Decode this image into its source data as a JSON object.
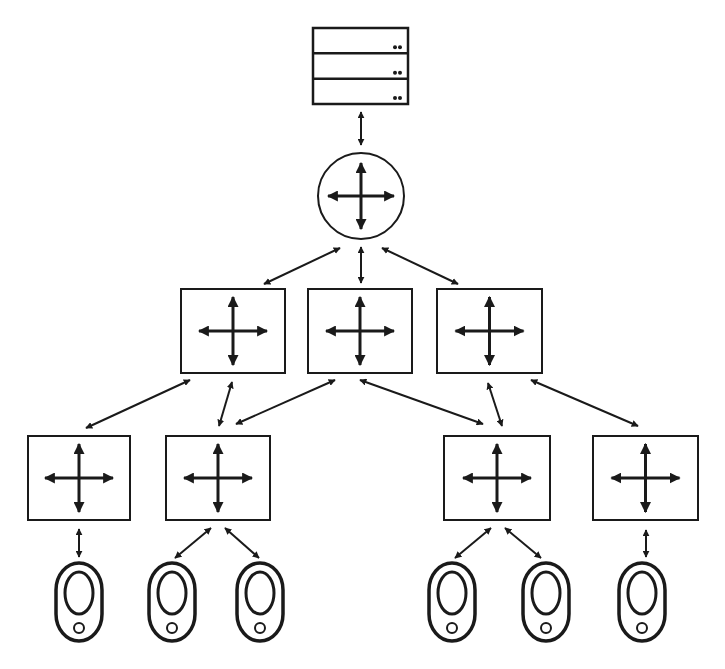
{
  "diagram": {
    "stroke_color": "#1a1a1a",
    "background": "#ffffff",
    "nodes": {
      "server": {
        "type": "server-rack",
        "x": 313,
        "y": 28,
        "w": 95,
        "h": 76,
        "units": 3
      },
      "router": {
        "type": "router",
        "cx": 361,
        "cy": 196,
        "r": 43
      },
      "distribution_switches": [
        {
          "id": "dist-1",
          "x": 181,
          "y": 289,
          "w": 104,
          "h": 84
        },
        {
          "id": "dist-2",
          "x": 308,
          "y": 289,
          "w": 104,
          "h": 84
        },
        {
          "id": "dist-3",
          "x": 437,
          "y": 289,
          "w": 105,
          "h": 84
        }
      ],
      "access_switches": [
        {
          "id": "acc-1",
          "x": 28,
          "y": 436,
          "w": 102,
          "h": 84
        },
        {
          "id": "acc-2",
          "x": 166,
          "y": 436,
          "w": 104,
          "h": 84
        },
        {
          "id": "acc-3",
          "x": 444,
          "y": 436,
          "w": 106,
          "h": 84
        },
        {
          "id": "acc-4",
          "x": 593,
          "y": 436,
          "w": 105,
          "h": 84
        }
      ],
      "end_devices": [
        {
          "id": "dev-1",
          "cx": 79,
          "top": 563
        },
        {
          "id": "dev-2",
          "cx": 172,
          "top": 563
        },
        {
          "id": "dev-3",
          "cx": 260,
          "top": 563
        },
        {
          "id": "dev-4",
          "cx": 452,
          "top": 563
        },
        {
          "id": "dev-5",
          "cx": 546,
          "top": 563
        },
        {
          "id": "dev-6",
          "cx": 642,
          "top": 563
        }
      ]
    },
    "links": [
      {
        "from": "server",
        "to": "router",
        "x1": 361,
        "y1": 112,
        "x2": 361,
        "y2": 145
      },
      {
        "from": "router",
        "to": "dist-1",
        "x1": 340,
        "y1": 248,
        "x2": 264,
        "y2": 284
      },
      {
        "from": "router",
        "to": "dist-2",
        "x1": 361,
        "y1": 247,
        "x2": 361,
        "y2": 283
      },
      {
        "from": "router",
        "to": "dist-3",
        "x1": 382,
        "y1": 248,
        "x2": 458,
        "y2": 284
      },
      {
        "from": "dist-1",
        "to": "acc-1",
        "x1": 190,
        "y1": 380,
        "x2": 86,
        "y2": 428
      },
      {
        "from": "dist-1",
        "to": "acc-2",
        "x1": 232,
        "y1": 382,
        "x2": 219,
        "y2": 426
      },
      {
        "from": "dist-2",
        "to": "acc-2",
        "x1": 335,
        "y1": 380,
        "x2": 236,
        "y2": 424
      },
      {
        "from": "dist-2",
        "to": "acc-3",
        "x1": 360,
        "y1": 380,
        "x2": 483,
        "y2": 424
      },
      {
        "from": "dist-3",
        "to": "acc-3",
        "x1": 488,
        "y1": 383,
        "x2": 502,
        "y2": 426
      },
      {
        "from": "dist-3",
        "to": "acc-4",
        "x1": 531,
        "y1": 380,
        "x2": 638,
        "y2": 426
      },
      {
        "from": "acc-1",
        "to": "dev-1",
        "x1": 79,
        "y1": 529,
        "x2": 79,
        "y2": 557
      },
      {
        "from": "acc-2",
        "to": "dev-2",
        "x1": 211,
        "y1": 528,
        "x2": 175,
        "y2": 558
      },
      {
        "from": "acc-2",
        "to": "dev-3",
        "x1": 225,
        "y1": 528,
        "x2": 259,
        "y2": 558
      },
      {
        "from": "acc-3",
        "to": "dev-4",
        "x1": 491,
        "y1": 528,
        "x2": 455,
        "y2": 558
      },
      {
        "from": "acc-3",
        "to": "dev-5",
        "x1": 505,
        "y1": 528,
        "x2": 541,
        "y2": 558
      },
      {
        "from": "acc-4",
        "to": "dev-6",
        "x1": 646,
        "y1": 530,
        "x2": 646,
        "y2": 557
      }
    ]
  }
}
